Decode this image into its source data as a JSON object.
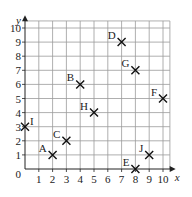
{
  "chart_data": {
    "type": "scatter",
    "title": "",
    "xlabel": "x",
    "ylabel": "y",
    "xlim": [
      0,
      10
    ],
    "ylim": [
      0,
      10
    ],
    "grid": true,
    "marker": "cross",
    "x_ticks": [
      "1",
      "2",
      "3",
      "4",
      "5",
      "6",
      "7",
      "8",
      "9",
      "10"
    ],
    "y_ticks": [
      "1",
      "2",
      "3",
      "4",
      "5",
      "6",
      "7",
      "8",
      "9",
      "10"
    ],
    "origin_label": "0",
    "points": [
      {
        "label": "A",
        "x": 2,
        "y": 1
      },
      {
        "label": "B",
        "x": 4,
        "y": 6
      },
      {
        "label": "C",
        "x": 3,
        "y": 2
      },
      {
        "label": "D",
        "x": 7,
        "y": 9
      },
      {
        "label": "E",
        "x": 8,
        "y": 0
      },
      {
        "label": "F",
        "x": 10,
        "y": 5
      },
      {
        "label": "G",
        "x": 8,
        "y": 7
      },
      {
        "label": "H",
        "x": 5,
        "y": 4
      },
      {
        "label": "I",
        "x": 0,
        "y": 3
      },
      {
        "label": "J",
        "x": 9,
        "y": 1
      }
    ]
  }
}
